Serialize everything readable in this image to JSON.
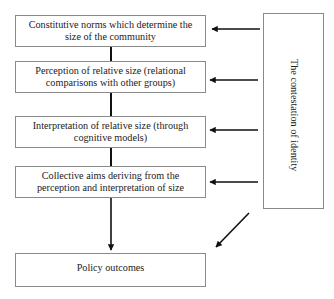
{
  "diagram": {
    "steps": [
      {
        "label": "Constitutive norms which determine the size of the community"
      },
      {
        "label": "Perception of relative size (relational comparisons with other groups)"
      },
      {
        "label": "Interpretation of relative size (through cognitive models)"
      },
      {
        "label": "Collective aims deriving from the perception and interpretation of size"
      }
    ],
    "outcome": {
      "label": "Policy outcomes"
    },
    "side_box": {
      "label": "The contestation of identity"
    },
    "colors": {
      "border": "#8a8a8a",
      "arrow": "#111111",
      "text": "#222222"
    }
  }
}
